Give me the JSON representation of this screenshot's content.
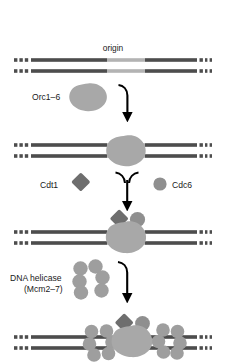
{
  "figure": {
    "type": "biological-pathway-diagram",
    "background_color": "#ffffff",
    "colors": {
      "dna_strand": "#4d4d4d",
      "dna_origin_segment": "#b3b3b3",
      "orc_complex": "#a8a8a8",
      "cdt1_diamond": "#6e6e6e",
      "cdc6_circle": "#8f8f8f",
      "mcm_subunit": "#9e9e9e",
      "arrow": "#000000",
      "text": "#1a1a1a"
    }
  },
  "labels": {
    "origin": "origin",
    "orc": "Orc1–6",
    "cdt1": "Cdt1",
    "cdc6": "Cdc6",
    "helicase_line1": "DNA helicase",
    "helicase_line2": "(Mcm2–7)"
  },
  "stages": [
    {
      "index": 1,
      "name": "naked-origin-dna",
      "description": "Double-stranded DNA with a lighter-shaded origin segment; no proteins bound.",
      "dna_y_top": 60,
      "dna_y_bottom": 71,
      "origin_label": "origin",
      "bound_factors": []
    },
    {
      "index": 2,
      "name": "orc-bound-origin",
      "description": "Orc1–6 complex bound at the origin as a single large blob spanning both strands.",
      "dna_y_top": 145,
      "dna_y_bottom": 156,
      "bound_factors": [
        "Orc1–6"
      ]
    },
    {
      "index": 3,
      "name": "orc-cdt1-cdc6-bound",
      "description": "Cdt1 (diamond) and Cdc6 (circle) dock onto the Orc1–6 complex at the origin.",
      "dna_y_top": 232,
      "dna_y_bottom": 243,
      "bound_factors": [
        "Orc1–6",
        "Cdt1",
        "Cdc6"
      ]
    },
    {
      "index": 4,
      "name": "pre-rc-with-mcm-double-hexamer",
      "description": "Two Mcm2–7 hexameric rings are loaded on either side of the Orc1–6/Cdt1/Cdc6 complex, completing the pre-replicative complex.",
      "dna_y_top": 337,
      "dna_y_bottom": 348,
      "bound_factors": [
        "Orc1–6",
        "Cdt1",
        "Cdc6",
        "Mcm2–7",
        "Mcm2–7"
      ]
    }
  ],
  "reagents": [
    {
      "name": "orc-reagent",
      "label": "Orc1–6",
      "glyph": "blob",
      "stage_from": 1,
      "stage_to": 2
    },
    {
      "name": "cdt1-reagent",
      "label": "Cdt1",
      "glyph": "diamond",
      "stage_from": 2,
      "stage_to": 3
    },
    {
      "name": "cdc6-reagent",
      "label": "Cdc6",
      "glyph": "circle",
      "stage_from": 2,
      "stage_to": 3
    },
    {
      "name": "mcm-helicase-reagent",
      "label": "DNA helicase (Mcm2–7)",
      "glyph": "hexamer-ring",
      "stage_from": 3,
      "stage_to": 4
    }
  ],
  "arrows": [
    {
      "name": "arrow-stage1-to-stage2",
      "hooks": [
        "left"
      ]
    },
    {
      "name": "arrow-stage2-to-stage3",
      "hooks": [
        "left",
        "right"
      ]
    },
    {
      "name": "arrow-stage3-to-stage4",
      "hooks": [
        "left"
      ]
    }
  ]
}
